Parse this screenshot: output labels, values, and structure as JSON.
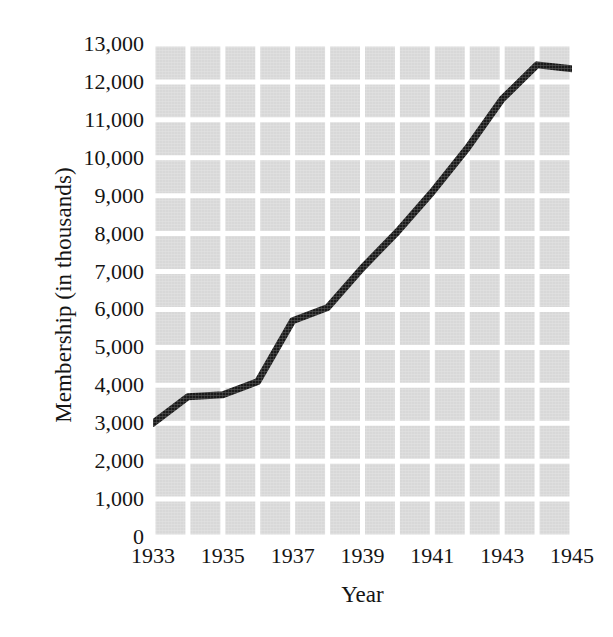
{
  "chart_data": {
    "type": "line",
    "title": "",
    "xlabel": "Year",
    "ylabel": "Membership (in thousands)",
    "x": [
      1933,
      1934,
      1935,
      1936,
      1937,
      1938,
      1939,
      1940,
      1941,
      1942,
      1943,
      1944,
      1945
    ],
    "values": [
      3000,
      3700,
      3750,
      4100,
      5700,
      6050,
      7100,
      8050,
      9100,
      10250,
      11550,
      12450,
      12350
    ],
    "series": [
      {
        "name": "Membership",
        "values": [
          3000,
          3700,
          3750,
          4100,
          5700,
          6050,
          7100,
          8050,
          9100,
          10250,
          11550,
          12450,
          12350
        ]
      }
    ],
    "xlim": [
      1933,
      1945
    ],
    "ylim": [
      0,
      13000
    ],
    "x_tick_labels": [
      "1933",
      "1935",
      "1937",
      "1939",
      "1941",
      "1943",
      "1945"
    ],
    "x_tick_values": [
      1933,
      1935,
      1937,
      1939,
      1941,
      1943,
      1945
    ],
    "y_tick_labels": [
      "13,000",
      "12,000",
      "11,000",
      "10,000",
      "9,000",
      "8,000",
      "7,000",
      "6,000",
      "5,000",
      "4,000",
      "3,000",
      "2,000",
      "1,000",
      "0"
    ],
    "y_tick_values": [
      13000,
      12000,
      11000,
      10000,
      9000,
      8000,
      7000,
      6000,
      5000,
      4000,
      3000,
      2000,
      1000,
      0
    ],
    "grid": true,
    "grid_color": "#ffffff",
    "plot_background": "#d8d8d8",
    "line_color": "#1a1a1a",
    "line_width": 7,
    "markers": false,
    "legend": false,
    "legend_position": "none"
  }
}
